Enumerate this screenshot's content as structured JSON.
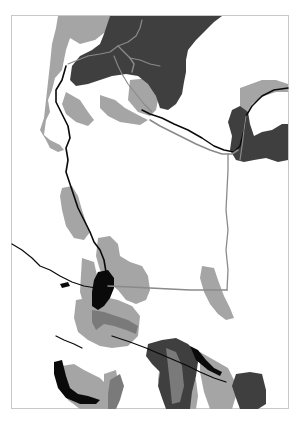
{
  "map": {
    "type": "grayscale-thematic-map",
    "frame": {
      "x": 11,
      "y": 15,
      "width": 277,
      "height": 394,
      "border_color": "#c8c8c8"
    },
    "colors": {
      "background": "#ffffff",
      "dark_zone": "#3f3f3f",
      "light_zone": "#a5a5a5",
      "mid_zone": "#7a7a7a",
      "water_black": "#0a0a0a",
      "road_line": "#8a8a8a"
    },
    "legend": [],
    "labels": []
  }
}
